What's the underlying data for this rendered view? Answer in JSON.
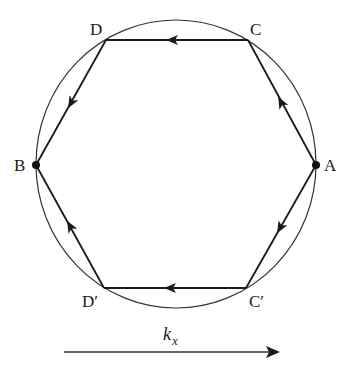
{
  "diagram": {
    "type": "hexagon-in-circle",
    "colors": {
      "stroke": "#1a1a1a",
      "background": "#ffffff"
    },
    "circle": {
      "cx": 176,
      "cy": 164,
      "rx": 140,
      "ry": 144
    },
    "vertices": [
      {
        "id": "D",
        "label": "D",
        "x": 106,
        "y": 40,
        "lx": 90,
        "ly": 35
      },
      {
        "id": "C",
        "label": "C",
        "x": 248,
        "y": 40,
        "lx": 250,
        "ly": 35
      },
      {
        "id": "A",
        "label": "A",
        "x": 316,
        "y": 165,
        "lx": 324,
        "ly": 171,
        "dot": true
      },
      {
        "id": "Cp",
        "label": "C′",
        "x": 246,
        "y": 288,
        "lx": 249,
        "ly": 307
      },
      {
        "id": "Dp",
        "label": "D′",
        "x": 104,
        "y": 288,
        "lx": 82,
        "ly": 307
      },
      {
        "id": "B",
        "label": "B",
        "x": 36,
        "y": 165,
        "lx": 14,
        "ly": 171,
        "dot": true
      }
    ],
    "edges": [
      {
        "from": "C",
        "to": "D",
        "direction": "leftward"
      },
      {
        "from": "D",
        "to": "B",
        "direction": "down-left"
      },
      {
        "from": "A",
        "to": "C",
        "direction": "up-left"
      },
      {
        "from": "A",
        "to": "Cp",
        "direction": "down-left"
      },
      {
        "from": "Cp",
        "to": "Dp",
        "direction": "leftward"
      },
      {
        "from": "Dp",
        "to": "B",
        "direction": "up-left"
      }
    ],
    "axis": {
      "label": "k",
      "subscript": "x",
      "x1": 64,
      "x2": 278,
      "y": 352,
      "direction": "rightward"
    }
  }
}
